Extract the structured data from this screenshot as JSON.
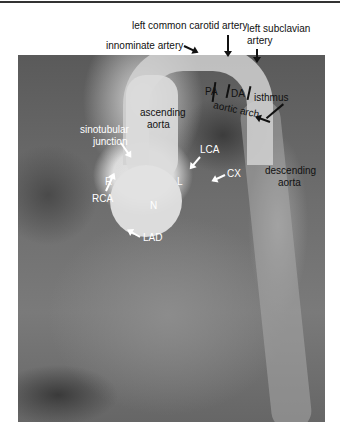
{
  "figure": {
    "type": "annotated aortogram",
    "labels_outside": {
      "left_common_carotid": "left common carotid artery",
      "left_subclavian_line1": "left subclavian",
      "left_subclavian_line2": "artery",
      "innominate": "innominate artery"
    },
    "labels_dark": {
      "pa": "PA",
      "da": "DA",
      "isthmus": "isthmus",
      "aortic_arch": "aortic arch",
      "ascending_line1": "ascending",
      "ascending_line2": "aorta",
      "descending_line1": "descending",
      "descending_line2": "aorta"
    },
    "labels_light": {
      "sinotubular_line1": "sinotubular",
      "sinotubular_line2": "junction",
      "lca": "LCA",
      "cx": "CX",
      "rca": "RCA",
      "r": "R",
      "l": "L",
      "n": "N",
      "lad": "LAD"
    }
  }
}
